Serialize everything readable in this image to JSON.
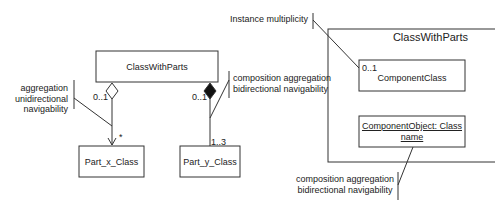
{
  "left_diagram": {
    "whole_class": "ClassWithParts",
    "part_x": {
      "name": "Part_x_Class",
      "whole_multiplicity": "0..1",
      "part_multiplicity": "*",
      "aggregation": "hollow-diamond",
      "note": [
        "aggregation",
        "unidirectional",
        "navigability"
      ]
    },
    "part_y": {
      "name": "Part_y_Class",
      "whole_multiplicity": "0..1",
      "part_multiplicity": "1..3",
      "aggregation": "filled-diamond",
      "note": [
        "composition aggregation",
        "bidirectional navigability"
      ]
    }
  },
  "right_diagram": {
    "container_title": "ClassWithParts",
    "component_class": {
      "multiplicity": "0..1",
      "name": "ComponentClass"
    },
    "component_object": {
      "line1": "ComponentObject: Class",
      "line2": "name"
    },
    "note_top": "Instance multiplicity",
    "note_bottom": [
      "composition aggregation",
      "bidirectional navigability"
    ]
  },
  "colors": {
    "line": "#333333",
    "background": "#ffffff"
  }
}
